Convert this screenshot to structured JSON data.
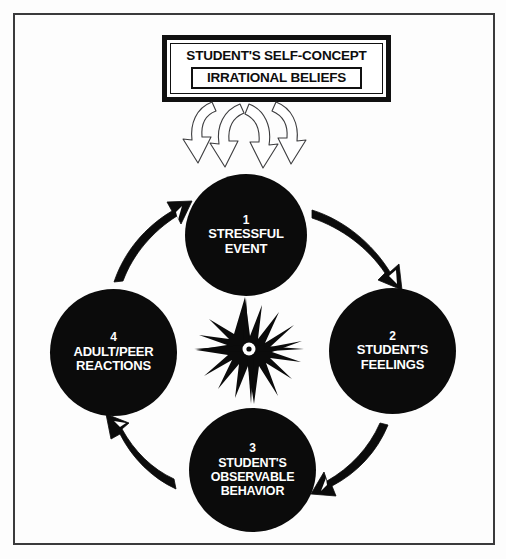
{
  "diagram": {
    "header": {
      "self_concept_label": "STUDENT'S SELF-CONCEPT",
      "beliefs_label": "IRRATIONAL BELIEFS"
    },
    "center": {
      "icon_name": "starburst-icon"
    },
    "nodes": [
      {
        "number": "1",
        "lines": [
          "STRESSFUL",
          "EVENT"
        ],
        "line1": "STRESSFUL",
        "line2": "EVENT",
        "line3": ""
      },
      {
        "number": "2",
        "lines": [
          "STUDENT'S",
          "FEELINGS"
        ],
        "line1": "STUDENT'S",
        "line2": "FEELINGS",
        "line3": ""
      },
      {
        "number": "3",
        "lines": [
          "STUDENT'S",
          "OBSERVABLE",
          "BEHAVIOR"
        ],
        "line1": "STUDENT'S",
        "line2": "OBSERVABLE",
        "line3": "BEHAVIOR"
      },
      {
        "number": "4",
        "lines": [
          "ADULT/PEER",
          "REACTIONS"
        ],
        "line1": "ADULT/PEER",
        "line2": "REACTIONS",
        "line3": ""
      }
    ],
    "connectors": [
      {
        "name": "arrow-belief-to-event",
        "style": "double-loop-outline",
        "direction": "bidirectional"
      },
      {
        "name": "arrow-1-to-2",
        "style": "tapered-solid",
        "direction": "clockwise"
      },
      {
        "name": "arrow-2-to-3",
        "style": "tapered-solid",
        "direction": "clockwise"
      },
      {
        "name": "arrow-3-to-4",
        "style": "tapered-solid",
        "direction": "clockwise"
      },
      {
        "name": "arrow-4-to-1",
        "style": "tapered-solid",
        "direction": "clockwise"
      }
    ],
    "colors": {
      "node_fill": "#0b0b0b",
      "node_text": "#ffffff",
      "ink": "#111111",
      "frame": "#3a3a3c",
      "page": "#fdfdfd"
    }
  }
}
